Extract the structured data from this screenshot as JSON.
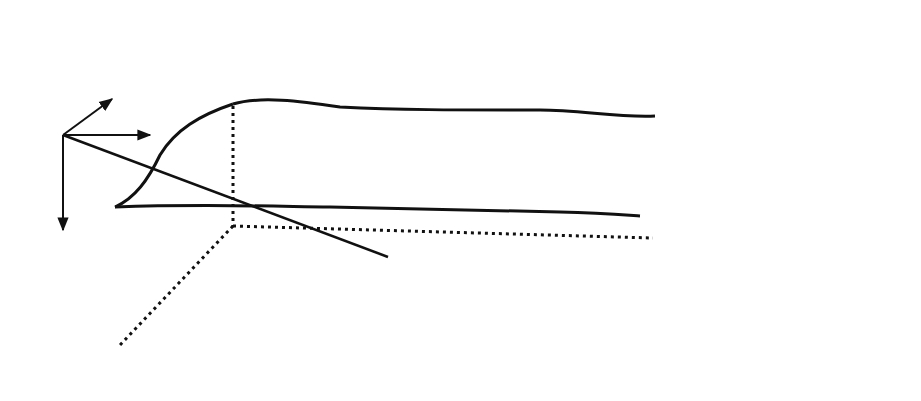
{
  "figure": {
    "labels": {
      "origin": "O",
      "axis_x": "x",
      "axis_y": "y",
      "axis_z": "z",
      "probe_center": "(x₀,y₀)",
      "probe_center_x": "(x",
      "probe_center_sub0": "o",
      "probe_center_mid": ",y",
      "probe_center_sub1": "o",
      "probe_center_close": ")",
      "probe": "probe",
      "detector": "detector",
      "theta": "θ",
      "position_vector": "r",
      "volume_element": "dV",
      "distance": "d(r)",
      "distance_prefix": "d(",
      "distance_r": "r",
      "distance_suffix": ")",
      "specimen": "specimen"
    },
    "caption": {
      "line1": "Fig. 1.    Cross section of a",
      "line2": "beam-specimen interaction"
    },
    "colors": {
      "ink": "#111111",
      "shading": "#bdbdbd",
      "background": "#ffffff"
    }
  }
}
